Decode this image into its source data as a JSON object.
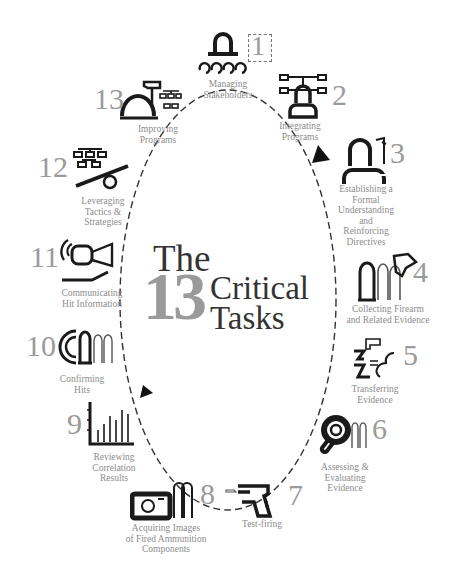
{
  "title": {
    "line1": "The",
    "number": "13",
    "line2": "Critical",
    "line3": "Tasks"
  },
  "colors": {
    "number_gray": "#9a9a9a",
    "label_gray": "#8c8c8c",
    "icon_black": "#1a1a1a",
    "title_dark": "#333333"
  },
  "tasks": [
    {
      "num": "1",
      "label": "Managing\nStakeholders",
      "icon": "stakeholders-icon"
    },
    {
      "num": "2",
      "label": "Integrating\nPrograms",
      "icon": "integrating-programs-icon"
    },
    {
      "num": "3",
      "label": "Establishing a\nFormal\nUnderstanding\nand\nReinforcing\nDirectives",
      "icon": "formal-understanding-icon"
    },
    {
      "num": "4",
      "label": "Collecting Firearm\nand Related Evidence",
      "icon": "collecting-firearm-icon"
    },
    {
      "num": "5",
      "label": "Transferring\nEvidence",
      "icon": "transferring-evidence-icon"
    },
    {
      "num": "6",
      "label": "Assessing &\nEvaluating\nEvidence",
      "icon": "magnifier-icon"
    },
    {
      "num": "7",
      "label": "Test-firing",
      "icon": "pistol-icon"
    },
    {
      "num": "8",
      "label": "Acquiring Images\nof Fired Ammunition\nComponents",
      "icon": "camera-icon"
    },
    {
      "num": "9",
      "label": "Reviewing\nCorrelation\nResults",
      "icon": "bar-chart-icon"
    },
    {
      "num": "10",
      "label": "Confirming\nHits",
      "icon": "confirming-hits-icon"
    },
    {
      "num": "11",
      "label": "Communicating\nHit Information",
      "icon": "megaphone-icon"
    },
    {
      "num": "12",
      "label": "Leveraging\nTactics &\nStrategies",
      "icon": "org-chart-lever-icon"
    },
    {
      "num": "13",
      "label": "Improving\nPrograms",
      "icon": "hammer-dome-icon"
    }
  ]
}
